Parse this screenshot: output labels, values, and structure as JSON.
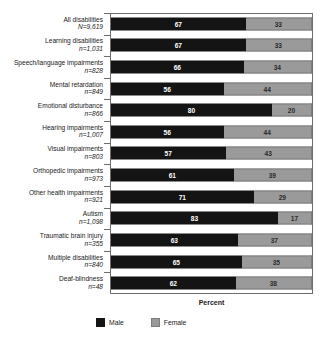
{
  "chart_data": {
    "type": "bar",
    "subtype": "stacked-horizontal-100pct",
    "title": "",
    "xlabel": "Percent",
    "ylabel": "",
    "xlim": [
      0,
      100
    ],
    "grid": false,
    "legend_position": "bottom-left",
    "categories": [
      "All disabilities",
      "Learning disabilities",
      "Speech/language impairments",
      "Mental retardation",
      "Emotional disturbance",
      "Hearing impairments",
      "Visual impairments",
      "Orthopedic impairments",
      "Other health impairments",
      "Autism",
      "Traumatic brain injury",
      "Multiple disabilities",
      "Deaf-blindness"
    ],
    "sample_sizes": [
      "N=9,619",
      "n=1,031",
      "n=828",
      "n=849",
      "n=866",
      "n=1,007",
      "n=803",
      "n=973",
      "n=921",
      "n=1,098",
      "n=355",
      "n=840",
      "n=48"
    ],
    "series": [
      {
        "name": "Male",
        "color": "#141414",
        "values": [
          67,
          67,
          66,
          56,
          80,
          56,
          57,
          61,
          71,
          83,
          63,
          65,
          62
        ]
      },
      {
        "name": "Female",
        "color": "#9a9a9a",
        "values": [
          33,
          33,
          34,
          44,
          20,
          44,
          43,
          39,
          29,
          17,
          37,
          35,
          38
        ]
      }
    ]
  },
  "legend": {
    "male_label": "Male",
    "female_label": "Female"
  },
  "axis": {
    "x_title": "Percent"
  }
}
